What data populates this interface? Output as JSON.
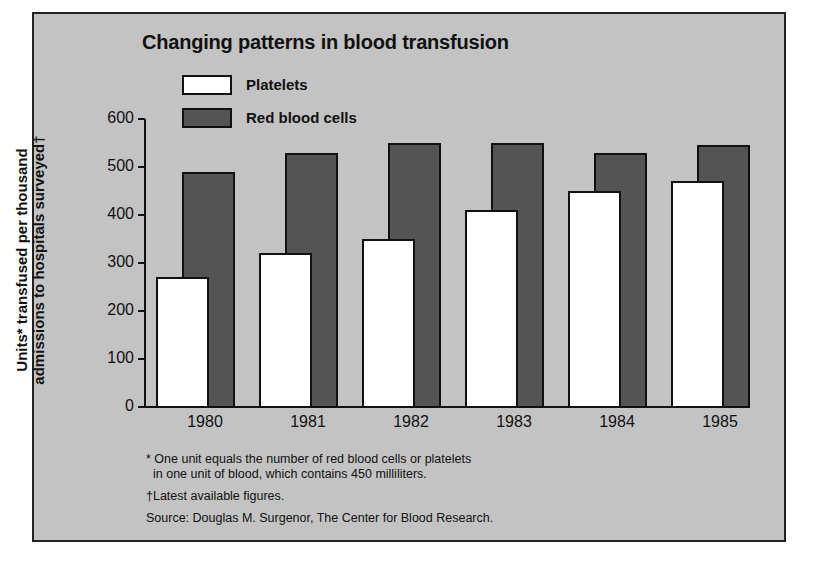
{
  "chart_data": {
    "type": "bar",
    "title": "Changing patterns in blood transfusion",
    "xlabel": "",
    "ylabel": "Units* transfused per thousand admissions to hospitals surveyed†",
    "ylabel_lines": [
      "Units* transfused per thousand",
      "admissions to hospitals surveyed†"
    ],
    "categories": [
      "1980",
      "1981",
      "1982",
      "1983",
      "1984",
      "1985"
    ],
    "series": [
      {
        "name": "Platelets",
        "color": "#ffffff",
        "values": [
          270,
          320,
          350,
          410,
          450,
          470
        ]
      },
      {
        "name": "Red blood cells",
        "color": "#545454",
        "values": [
          490,
          530,
          550,
          550,
          530,
          545
        ]
      }
    ],
    "ylim": [
      0,
      600
    ],
    "yticks": [
      0,
      100,
      200,
      300,
      400,
      500,
      600
    ],
    "grid": false,
    "legend_position": "top-left",
    "footnotes": [
      "* One unit equals the number of red blood cells or platelets",
      "in one unit of blood, which contains 450 milliliters.",
      "†Latest available figures.",
      "Source: Douglas M. Surgenor, The Center for Blood Research."
    ]
  },
  "colors": {
    "background": "#c3c3c3",
    "platelets": "#ffffff",
    "rbc": "#545454",
    "frame": "#222222"
  }
}
